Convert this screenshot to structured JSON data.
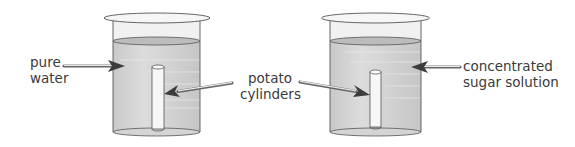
{
  "diagram": {
    "colors": {
      "outline": "#4a4a4a",
      "liquid": "#cfcfcf",
      "liquid_top": "#bdbdbd",
      "glass": "#efefef",
      "cylinder": "#f7f7f7",
      "arrow_head": "#3c3c3c",
      "text": "#3a3a3a"
    },
    "beakers": [
      {
        "id": "left",
        "contents": "pure water"
      },
      {
        "id": "right",
        "contents": "concentrated sugar solution"
      }
    ],
    "labels": {
      "pure_water": {
        "line1": "pure",
        "line2": "water"
      },
      "potato_cylinders": {
        "line1": "potato",
        "line2": "cylinders"
      },
      "sugar_solution": {
        "line1": "concentrated",
        "line2": "sugar solution"
      }
    }
  }
}
